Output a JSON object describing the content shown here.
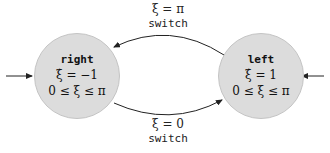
{
  "states": [
    {
      "id": "right",
      "name": "right",
      "dynamics": "ξ̇ = −1",
      "invariant": "0 ≤ ξ ≤ π",
      "initial_arrow": "left-side"
    },
    {
      "id": "left",
      "name": "left",
      "dynamics": "ξ̇ = 1",
      "invariant": "0 ≤ ξ ≤ π",
      "initial_arrow": "right-side"
    }
  ],
  "transitions": [
    {
      "from": "left",
      "to": "right",
      "guard": "ξ = π",
      "action": "switch",
      "position": "top"
    },
    {
      "from": "right",
      "to": "left",
      "guard": "ξ = 0",
      "action": "switch",
      "position": "bottom"
    }
  ],
  "colors": {
    "state_fill": "#dcdcdc",
    "state_border": "#c4c4c4",
    "edge": "#222222"
  }
}
